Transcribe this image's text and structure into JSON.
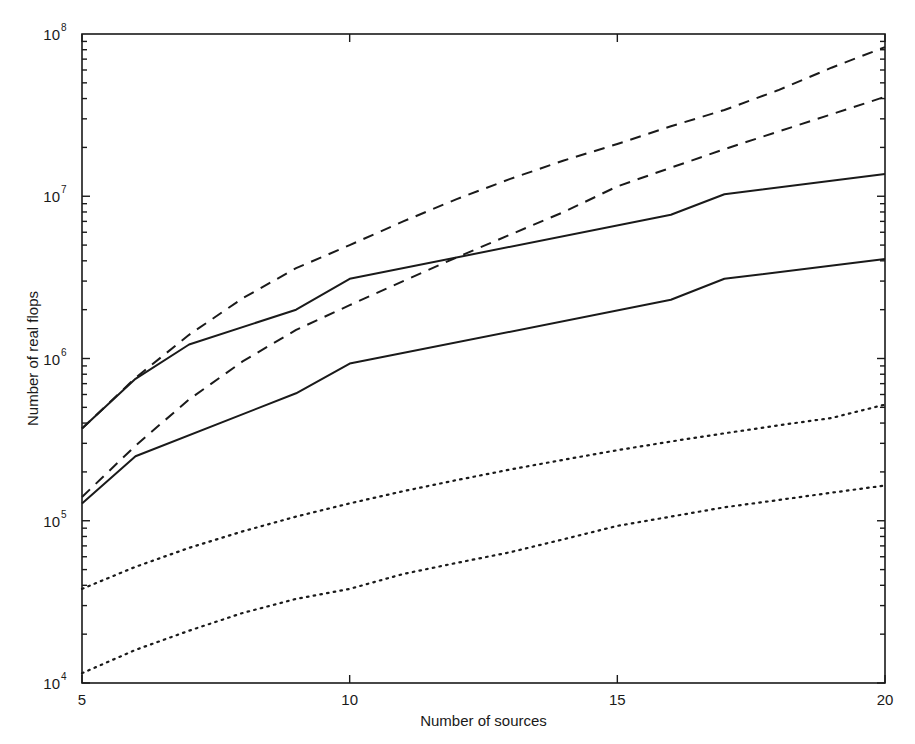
{
  "chart_data": {
    "type": "line",
    "title": "",
    "xlabel": "Number of sources",
    "ylabel": "Number of real flops",
    "xscale": "linear",
    "yscale": "log",
    "xlim": [
      5,
      20
    ],
    "ylim": [
      10000,
      100000000
    ],
    "grid": false,
    "legend": null,
    "x_ticks": [
      5,
      10,
      15,
      20
    ],
    "x_tick_labels": [
      "5",
      "10",
      "15",
      "20"
    ],
    "y_ticks": [
      10000,
      100000,
      1000000,
      10000000,
      100000000
    ],
    "y_tick_labels": [
      {
        "base": "10",
        "exp": "4"
      },
      {
        "base": "10",
        "exp": "5"
      },
      {
        "base": "10",
        "exp": "6"
      },
      {
        "base": "10",
        "exp": "7"
      },
      {
        "base": "10",
        "exp": "8"
      }
    ],
    "series": [
      {
        "name": "dashed-upper",
        "style": "dashed",
        "x": [
          5,
          6,
          7,
          8,
          9,
          10,
          11,
          12,
          13,
          14,
          15,
          16,
          17,
          18,
          19,
          20
        ],
        "values": [
          370000,
          760000,
          1400000,
          2350000,
          3600000,
          5000000,
          7000000,
          9600000,
          12800000,
          16600000,
          21000000,
          27000000,
          34000000,
          45000000,
          62000000,
          83000000
        ]
      },
      {
        "name": "dashed-lower",
        "style": "dashed",
        "x": [
          5,
          6,
          7,
          8,
          9,
          10,
          11,
          12,
          13,
          14,
          15,
          16,
          17,
          18,
          19,
          20
        ],
        "values": [
          140000,
          290000,
          560000,
          960000,
          1500000,
          2130000,
          3000000,
          4200000,
          5800000,
          8000000,
          11500000,
          15000000,
          19500000,
          25000000,
          32000000,
          41000000
        ]
      },
      {
        "name": "solid-upper",
        "style": "solid",
        "x": [
          5,
          6,
          7,
          9,
          10,
          16,
          17,
          20
        ],
        "values": [
          370000,
          750000,
          1220000,
          2000000,
          3100000,
          7700000,
          10300000,
          13700000
        ]
      },
      {
        "name": "solid-lower",
        "style": "solid",
        "x": [
          5,
          6,
          9,
          10,
          16,
          17,
          20
        ],
        "values": [
          128000,
          250000,
          610000,
          930000,
          2300000,
          3100000,
          4100000
        ]
      },
      {
        "name": "dotted-upper",
        "style": "dotted",
        "x": [
          5,
          6,
          7,
          8,
          9,
          10,
          11,
          12,
          13,
          14,
          15,
          16,
          17,
          18,
          19,
          20
        ],
        "values": [
          38000,
          52000,
          68000,
          86000,
          106000,
          128000,
          152000,
          178000,
          207000,
          238000,
          272000,
          308000,
          346000,
          387000,
          430000,
          520000
        ]
      },
      {
        "name": "dotted-lower",
        "style": "dotted",
        "x": [
          5,
          6,
          7,
          8,
          9,
          10,
          11,
          12,
          13,
          14,
          15,
          16,
          17,
          18,
          19,
          20
        ],
        "values": [
          11500,
          16000,
          21000,
          27000,
          33000,
          38000,
          47000,
          55000,
          64000,
          77000,
          93000,
          106000,
          121000,
          134000,
          149000,
          165000
        ]
      }
    ]
  },
  "layout": {
    "plot_left": 82,
    "plot_right": 885,
    "plot_top": 34,
    "plot_bottom": 683,
    "line_color": "#1a1a1a"
  }
}
